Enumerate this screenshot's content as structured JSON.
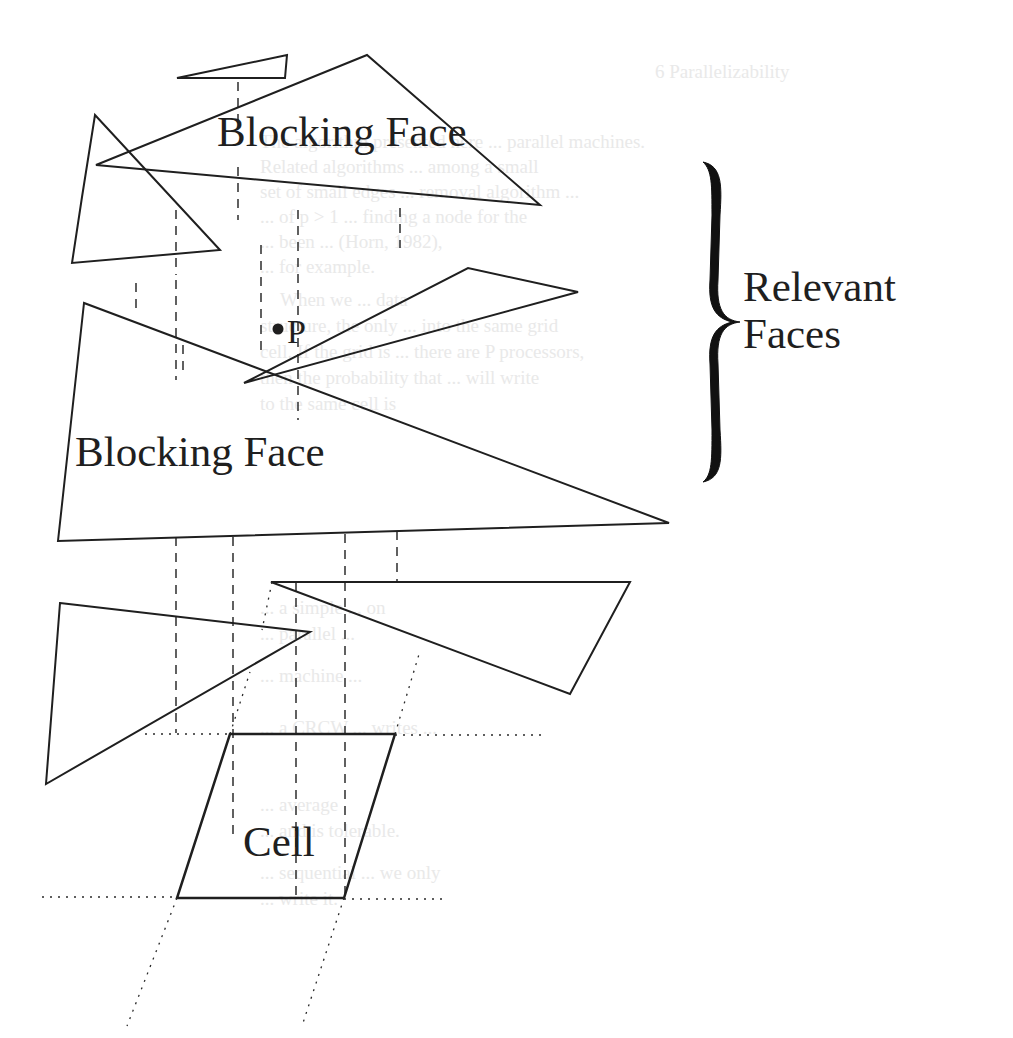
{
  "figure": {
    "labels": {
      "blocking_face_top": "Blocking Face",
      "blocking_face_mid": "Blocking Face",
      "point": "P",
      "relevant_faces_line1": "Relevant",
      "relevant_faces_line2": "Faces",
      "cell": "Cell"
    },
    "colors": {
      "ink": "#1f1f1f",
      "ghost_text": "#e9e9e9",
      "background": "#ffffff"
    },
    "shapes": [
      {
        "id": "small-top-triangle",
        "points": [
          [
            177,
            78
          ],
          [
            287,
            55
          ],
          [
            285,
            78
          ]
        ]
      },
      {
        "id": "blocking-face-top",
        "points": [
          [
            96,
            165
          ],
          [
            367,
            55
          ],
          [
            540,
            205
          ]
        ]
      },
      {
        "id": "left-relevant-triangle",
        "points": [
          [
            110,
            197
          ],
          [
            220,
            250
          ],
          [
            95,
            115
          ]
        ]
      },
      {
        "id": "right-relevant-triangle",
        "points": [
          [
            350,
            362
          ],
          [
            578,
            290
          ],
          [
            462,
            268
          ]
        ]
      },
      {
        "id": "blocking-face-mid",
        "points": [
          [
            83,
            303
          ],
          [
            56,
            540
          ],
          [
            667,
            523
          ]
        ]
      },
      {
        "id": "lower-right-triangle",
        "points": [
          [
            272,
            581
          ],
          [
            630,
            581
          ],
          [
            572,
            694
          ]
        ]
      },
      {
        "id": "lower-left-triangle",
        "points": [
          [
            60,
            603
          ],
          [
            310,
            632
          ],
          [
            55,
            793
          ]
        ]
      },
      {
        "id": "cell-parallelogram",
        "points": [
          [
            229,
            733
          ],
          [
            395,
            733
          ],
          [
            340,
            898
          ],
          [
            177,
            898
          ]
        ]
      }
    ],
    "ghost_text_lines": [
      "6 Parallelizability",
      "The algorithm presented here ... parallel machines.",
      "Related algorithms ... among a small",
      "set of small edges ... removal algorithm ...",
      "... of p > 1 ... finding a node for the",
      "... been ... (Horn, 1982),",
      "... for example.",
      "When we ... data",
      "structure, the only ... into the same grid",
      "cell. If the grid is ... there are P processors,",
      "then the probability that ... will write",
      "to the same cell is",
      "... a simple ... on",
      "... parallel ...",
      "... machine ...",
      "... a CRCW ... writes ...",
      "... average",
      "... and is tolerable.",
      "... sequential ... we only",
      "... write it."
    ]
  }
}
